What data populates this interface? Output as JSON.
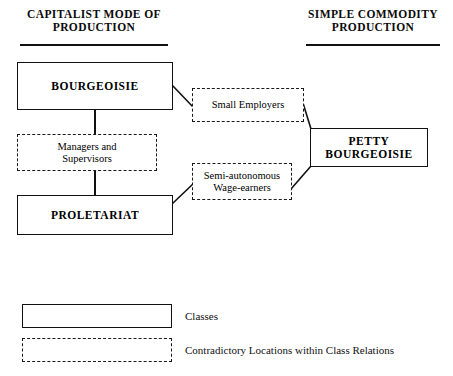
{
  "diagram": {
    "headings": [
      {
        "name": "capitalist-mode-heading",
        "text": "CAPITALIST MODE OF\nPRODUCTION"
      },
      {
        "name": "simple-commodity-heading",
        "text": "SIMPLE  COMMODITY\nPRODUCTION"
      }
    ],
    "nodes": {
      "bourgeoisie": {
        "label": "BOURGEOISIE",
        "type": "class"
      },
      "proletariat": {
        "label": "PROLETARIAT",
        "type": "class"
      },
      "petty_bourgeoisie": {
        "label": "PETTY\nBOURGEOISIE",
        "type": "class"
      },
      "managers": {
        "label": "Managers and\nSupervisors",
        "type": "contradictory-location"
      },
      "small_employers": {
        "label": "Small Employers",
        "type": "contradictory-location"
      },
      "semi_autonomous": {
        "label": "Semi-autonomous\nWage-earners",
        "type": "contradictory-location"
      }
    },
    "legend": {
      "classes_label": "Classes",
      "contradictory_label": "Contradictory Locations within Class Relations"
    },
    "colors": {
      "ink": "#111111",
      "background": "#ffffff"
    }
  }
}
